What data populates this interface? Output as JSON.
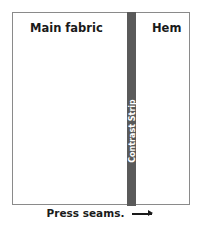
{
  "diagram": {
    "sections": [
      {
        "label": "Main fabric"
      },
      {
        "label": "Contrast Strip"
      },
      {
        "label": "Hem"
      }
    ],
    "caption": "Press seams.",
    "arrow_icon": "arrow-right-icon",
    "colors": {
      "strip": "#5a5a5a",
      "border": "#8a8a8a",
      "text": "#1a1a1a",
      "background": "#ffffff"
    }
  }
}
